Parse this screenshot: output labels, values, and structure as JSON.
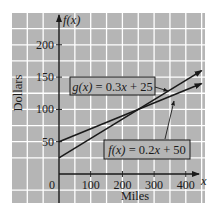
{
  "chart_data": {
    "type": "line",
    "title": "",
    "xlabel": "Miles",
    "ylabel": "Dollars",
    "x_axis_symbol": "x",
    "y_axis_symbol": "f(x)",
    "xlim": [
      -150,
      450
    ],
    "ylim": [
      -50,
      250
    ],
    "x_ticks": [
      100,
      200,
      300,
      400
    ],
    "y_ticks": [
      50,
      100,
      150,
      200
    ],
    "origin_label": "0",
    "grid": true,
    "grid_spacing": {
      "x": 50,
      "y": 25
    },
    "legend_position": "inline-callouts",
    "series": [
      {
        "name": "g(x) = 0.3x + 25",
        "label_parts": {
          "fn": "g(x)",
          "eq": " = 0.3",
          "var": "x",
          "rest": " + 25"
        },
        "slope": 0.3,
        "intercept": 25,
        "x": [
          0,
          450
        ],
        "values": [
          25,
          160
        ]
      },
      {
        "name": "f(x) = 0.2x + 50",
        "label_parts": {
          "fn": "f(x)",
          "eq": " = 0.2",
          "var": "x",
          "rest": " + 50"
        },
        "slope": 0.2,
        "intercept": 50,
        "x": [
          0,
          450
        ],
        "values": [
          50,
          140
        ]
      }
    ],
    "annotations": [
      {
        "text": "g(x) = 0.3x + 25",
        "points_to": "upper line"
      },
      {
        "text": "f(x) = 0.2x + 50",
        "points_to": "lower line"
      }
    ],
    "intersection": {
      "x": 250,
      "y": 100
    }
  },
  "colors": {
    "plot_background": "#b5b5b5",
    "grid": "#ffffff",
    "line": "#1a1a1a",
    "page": "#ffffff"
  }
}
